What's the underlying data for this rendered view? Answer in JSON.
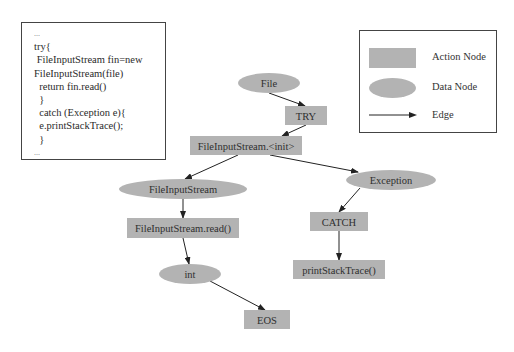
{
  "code_snippet": {
    "lines": [
      "...",
      "try{",
      " FileInputStream fin=new",
      "FileInputStream(file)",
      "  return fin.read()",
      "  }",
      "  catch (Exception e){",
      "  e.printStackTrace();",
      "  }",
      "..."
    ]
  },
  "legend": {
    "items": [
      {
        "shape": "rect",
        "label": "Action Node"
      },
      {
        "shape": "ellipse",
        "label": "Data Node"
      },
      {
        "shape": "arrow",
        "label": "Edge"
      }
    ]
  },
  "colors": {
    "node_fill": "#b3b3b3",
    "edge": "#222222",
    "border": "#444444"
  },
  "graph": {
    "nodes": [
      {
        "id": "file",
        "type": "data",
        "label": "File"
      },
      {
        "id": "try",
        "type": "action",
        "label": "TRY"
      },
      {
        "id": "fis_init",
        "type": "action",
        "label": "FileInputStream.<init>"
      },
      {
        "id": "fis",
        "type": "data",
        "label": "FileInputStream"
      },
      {
        "id": "exception",
        "type": "data",
        "label": "Exception"
      },
      {
        "id": "fis_read",
        "type": "action",
        "label": "FileInputStream.read()"
      },
      {
        "id": "catch",
        "type": "action",
        "label": "CATCH"
      },
      {
        "id": "int",
        "type": "data",
        "label": "int"
      },
      {
        "id": "pst",
        "type": "action",
        "label": "printStackTrace()"
      },
      {
        "id": "eos",
        "type": "action",
        "label": "EOS"
      }
    ],
    "edges": [
      {
        "from": "file",
        "to": "try"
      },
      {
        "from": "try",
        "to": "fis_init"
      },
      {
        "from": "fis_init",
        "to": "fis"
      },
      {
        "from": "fis_init",
        "to": "exception"
      },
      {
        "from": "fis",
        "to": "fis_read"
      },
      {
        "from": "fis_read",
        "to": "int"
      },
      {
        "from": "int",
        "to": "eos"
      },
      {
        "from": "exception",
        "to": "catch"
      },
      {
        "from": "catch",
        "to": "pst"
      }
    ]
  }
}
